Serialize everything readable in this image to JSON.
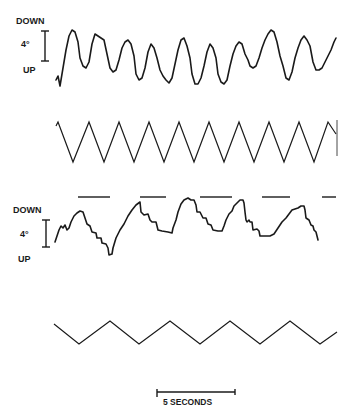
{
  "chart_data": [
    {
      "type": "line",
      "title": "",
      "panel": "eye-position-trace-1",
      "ylabel_top": "DOWN",
      "ylabel_bottom": "UP",
      "scale_label": "4°",
      "description": "Smooth sinusoidal-like eye position trace, ~11 cycles",
      "points": [
        [
          56,
          80
        ],
        [
          58,
          76
        ],
        [
          60,
          86
        ],
        [
          63,
          68
        ],
        [
          66,
          50
        ],
        [
          69,
          36
        ],
        [
          72,
          30
        ],
        [
          75,
          32
        ],
        [
          78,
          42
        ],
        [
          80,
          58
        ],
        [
          83,
          66
        ],
        [
          86,
          68
        ],
        [
          89,
          62
        ],
        [
          92,
          44
        ],
        [
          95,
          34
        ],
        [
          98,
          36
        ],
        [
          101,
          38
        ],
        [
          104,
          40
        ],
        [
          107,
          54
        ],
        [
          110,
          68
        ],
        [
          113,
          72
        ],
        [
          116,
          70
        ],
        [
          119,
          60
        ],
        [
          122,
          48
        ],
        [
          125,
          42
        ],
        [
          128,
          40
        ],
        [
          131,
          44
        ],
        [
          134,
          56
        ],
        [
          136,
          74
        ],
        [
          139,
          80
        ],
        [
          142,
          78
        ],
        [
          145,
          68
        ],
        [
          148,
          52
        ],
        [
          151,
          44
        ],
        [
          154,
          48
        ],
        [
          157,
          58
        ],
        [
          160,
          70
        ],
        [
          163,
          76
        ],
        [
          166,
          80
        ],
        [
          169,
          83
        ],
        [
          172,
          78
        ],
        [
          175,
          64
        ],
        [
          178,
          50
        ],
        [
          181,
          40
        ],
        [
          184,
          38
        ],
        [
          187,
          46
        ],
        [
          190,
          58
        ],
        [
          192,
          74
        ],
        [
          195,
          84
        ],
        [
          198,
          84
        ],
        [
          201,
          78
        ],
        [
          204,
          66
        ],
        [
          207,
          52
        ],
        [
          210,
          44
        ],
        [
          213,
          48
        ],
        [
          216,
          58
        ],
        [
          218,
          74
        ],
        [
          221,
          82
        ],
        [
          224,
          84
        ],
        [
          227,
          80
        ],
        [
          230,
          66
        ],
        [
          233,
          54
        ],
        [
          236,
          46
        ],
        [
          239,
          42
        ],
        [
          242,
          44
        ],
        [
          245,
          54
        ],
        [
          248,
          60
        ],
        [
          250,
          66
        ],
        [
          253,
          68
        ],
        [
          256,
          66
        ],
        [
          259,
          58
        ],
        [
          262,
          48
        ],
        [
          265,
          40
        ],
        [
          268,
          34
        ],
        [
          271,
          30
        ],
        [
          274,
          32
        ],
        [
          277,
          42
        ],
        [
          280,
          56
        ],
        [
          283,
          66
        ],
        [
          286,
          78
        ],
        [
          289,
          80
        ],
        [
          292,
          72
        ],
        [
          295,
          58
        ],
        [
          298,
          48
        ],
        [
          301,
          40
        ],
        [
          304,
          36
        ],
        [
          307,
          40
        ],
        [
          310,
          46
        ],
        [
          313,
          62
        ],
        [
          316,
          70
        ],
        [
          319,
          70
        ],
        [
          322,
          68
        ],
        [
          325,
          62
        ],
        [
          328,
          56
        ],
        [
          331,
          50
        ],
        [
          334,
          42
        ],
        [
          336,
          38
        ]
      ]
    },
    {
      "type": "line",
      "panel": "target-triangle-wave-fast",
      "description": "Triangular target motion, ~10 cycles",
      "peaks_y": 122,
      "troughs_y": 162,
      "points": [
        [
          56,
          126
        ],
        [
          58,
          122
        ],
        [
          73,
          162
        ],
        [
          89,
          122
        ],
        [
          104,
          162
        ],
        [
          119,
          122
        ],
        [
          134,
          162
        ],
        [
          149,
          122
        ],
        [
          164,
          162
        ],
        [
          179,
          122
        ],
        [
          194,
          162
        ],
        [
          209,
          122
        ],
        [
          224,
          162
        ],
        [
          239,
          122
        ],
        [
          254,
          162
        ],
        [
          269,
          122
        ],
        [
          284,
          162
        ],
        [
          299,
          122
        ],
        [
          314,
          162
        ],
        [
          328,
          122
        ],
        [
          336,
          134
        ]
      ]
    },
    {
      "type": "line",
      "panel": "eye-position-trace-2",
      "ylabel_top": "DOWN",
      "ylabel_bottom": "UP",
      "scale_label": "4°",
      "description": "Saccadic staircase eye position trace",
      "points": [
        [
          55,
          242
        ],
        [
          57,
          236
        ],
        [
          59,
          230
        ],
        [
          61,
          226
        ],
        [
          63,
          228
        ],
        [
          65,
          225
        ],
        [
          67,
          230
        ],
        [
          69,
          228
        ],
        [
          71,
          222
        ],
        [
          74,
          216
        ],
        [
          77,
          213
        ],
        [
          80,
          211
        ],
        [
          83,
          212
        ],
        [
          85,
          218
        ],
        [
          87,
          224
        ],
        [
          90,
          226
        ],
        [
          92,
          232
        ],
        [
          96,
          233
        ],
        [
          97,
          238
        ],
        [
          101,
          238
        ],
        [
          102,
          243
        ],
        [
          106,
          244
        ],
        [
          108,
          248
        ],
        [
          109,
          255
        ],
        [
          112,
          254
        ],
        [
          113,
          248
        ],
        [
          116,
          238
        ],
        [
          120,
          230
        ],
        [
          124,
          224
        ],
        [
          128,
          216
        ],
        [
          132,
          210
        ],
        [
          136,
          205
        ],
        [
          140,
          202
        ],
        [
          141,
          212
        ],
        [
          144,
          215
        ],
        [
          148,
          214
        ],
        [
          150,
          220
        ],
        [
          152,
          222
        ],
        [
          156,
          222
        ],
        [
          158,
          230
        ],
        [
          162,
          231
        ],
        [
          168,
          232
        ],
        [
          172,
          233
        ],
        [
          173,
          228
        ],
        [
          176,
          220
        ],
        [
          178,
          212
        ],
        [
          181,
          204
        ],
        [
          184,
          200
        ],
        [
          188,
          198
        ],
        [
          191,
          200
        ],
        [
          194,
          200
        ],
        [
          196,
          205
        ],
        [
          197,
          212
        ],
        [
          200,
          212
        ],
        [
          203,
          218
        ],
        [
          206,
          218
        ],
        [
          208,
          224
        ],
        [
          211,
          225
        ],
        [
          213,
          230
        ],
        [
          218,
          231
        ],
        [
          222,
          231
        ],
        [
          224,
          226
        ],
        [
          226,
          220
        ],
        [
          229,
          214
        ],
        [
          232,
          211
        ],
        [
          234,
          206
        ],
        [
          237,
          203
        ],
        [
          240,
          200
        ],
        [
          243,
          200
        ],
        [
          244,
          203
        ],
        [
          245,
          212
        ],
        [
          246,
          220
        ],
        [
          247,
          222
        ],
        [
          249,
          220
        ],
        [
          250,
          222
        ],
        [
          252,
          222
        ],
        [
          253,
          230
        ],
        [
          257,
          229
        ],
        [
          259,
          231
        ],
        [
          260,
          236
        ],
        [
          264,
          236
        ],
        [
          270,
          236
        ],
        [
          274,
          234
        ],
        [
          278,
          228
        ],
        [
          282,
          222
        ],
        [
          286,
          218
        ],
        [
          289,
          214
        ],
        [
          292,
          210
        ],
        [
          295,
          209
        ],
        [
          298,
          208
        ],
        [
          301,
          206
        ],
        [
          304,
          206
        ],
        [
          305,
          210
        ],
        [
          306,
          218
        ],
        [
          309,
          220
        ],
        [
          311,
          225
        ],
        [
          313,
          226
        ],
        [
          314,
          230
        ],
        [
          316,
          232
        ],
        [
          318,
          240
        ]
      ]
    },
    {
      "type": "bar",
      "panel": "stimulus-markers",
      "description": "Horizontal stimulus/event marker bars above trace 2",
      "y": 197,
      "segments": [
        [
          78,
          110
        ],
        [
          140,
          166
        ],
        [
          200,
          232
        ],
        [
          262,
          290
        ],
        [
          322,
          336
        ]
      ]
    },
    {
      "type": "line",
      "panel": "target-triangle-wave-slow",
      "description": "Slow triangular target motion, ~5 cycles",
      "peaks_y": 321,
      "troughs_y": 344,
      "points": [
        [
          54,
          324
        ],
        [
          79,
          344
        ],
        [
          110,
          321
        ],
        [
          139,
          344
        ],
        [
          170,
          321
        ],
        [
          200,
          344
        ],
        [
          230,
          321
        ],
        [
          260,
          344
        ],
        [
          290,
          321
        ],
        [
          320,
          344
        ],
        [
          337,
          332
        ]
      ]
    }
  ],
  "labels": {
    "trace1_down": "DOWN",
    "trace1_scale": "4°",
    "trace1_up": "UP",
    "trace2_down": "DOWN",
    "trace2_scale": "4°",
    "trace2_up": "UP",
    "time_scale": "5 SECONDS"
  }
}
